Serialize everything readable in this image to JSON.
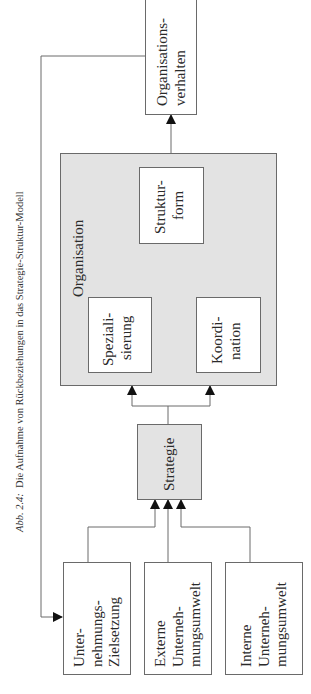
{
  "caption": {
    "number": "Abb. 2.4:",
    "text": "Die Aufnahme von Rückbeziehungen in das Strategie-Struktur-Modell"
  },
  "nodes": {
    "organisationsverhalten": [
      "Organisations-",
      "verhalten"
    ],
    "organisation": "Organisation",
    "strukturform": [
      "Struktur-",
      "form"
    ],
    "spezialisierung": [
      "Speziali-",
      "sierung"
    ],
    "koordination": [
      "Koordi-",
      "nation"
    ],
    "strategie": "Strategie",
    "zielsetzung": [
      "Unter-",
      "nehmungs-",
      "Zielsetzung"
    ],
    "externe_umwelt": [
      "Externe",
      "Unterneh-",
      "mungsumwelt"
    ],
    "interne_umwelt": [
      "Interne",
      "Unterneh-",
      "mungsumwelt"
    ]
  },
  "colors": {
    "line": "#6a6a6a",
    "arrow": "#111111",
    "grey_fill": "#e3e3e3",
    "white_fill": "#ffffff"
  },
  "edges": [
    {
      "from": "Unternehmungs-Zielsetzung",
      "to": "Strategie"
    },
    {
      "from": "Externe Unternehmungsumwelt",
      "to": "Strategie"
    },
    {
      "from": "Interne Unternehmungsumwelt",
      "to": "Strategie"
    },
    {
      "from": "Strategie",
      "to": "Spezialisierung"
    },
    {
      "from": "Strategie",
      "to": "Koordination"
    },
    {
      "from": "Spezialisierung",
      "to": "Strukturform"
    },
    {
      "from": "Koordination",
      "to": "Strukturform"
    },
    {
      "from": "Organisation",
      "to": "Organisationsverhalten"
    },
    {
      "from": "Organisationsverhalten",
      "to": "Unternehmungs-Zielsetzung",
      "type": "feedback"
    }
  ]
}
